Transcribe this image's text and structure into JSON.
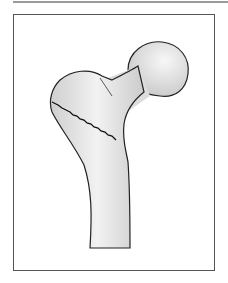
{
  "figure": {
    "colors": {
      "bone_fill": "#e6e6e6",
      "outline": "#222222",
      "frame": "#555555",
      "rule": "#9a9a9a"
    }
  }
}
